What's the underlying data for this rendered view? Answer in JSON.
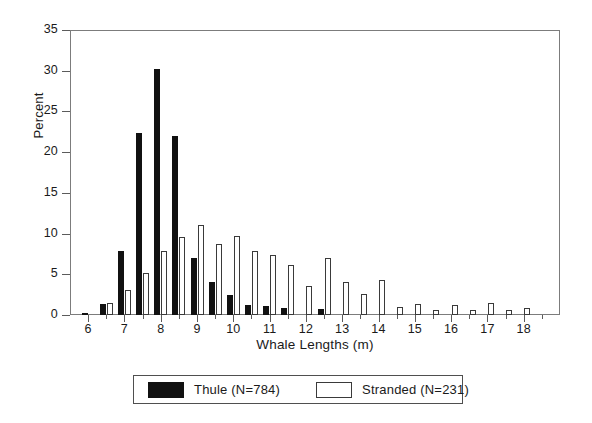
{
  "chart_data": {
    "type": "bar",
    "title": "",
    "xlabel": "Whale Lengths (m)",
    "ylabel": "Percent",
    "xlim": [
      5.5,
      19.0
    ],
    "ylim": [
      0,
      35
    ],
    "ytick_values": [
      0,
      5,
      10,
      15,
      20,
      25,
      30,
      35
    ],
    "ytick_labels": [
      "0",
      "5",
      "10",
      "15",
      "20",
      "25",
      "30",
      "35"
    ],
    "xtick_major_values": [
      6,
      7,
      8,
      9,
      10,
      11,
      12,
      13,
      14,
      15,
      16,
      17,
      18
    ],
    "xtick_major_labels": [
      "6",
      "7",
      "8",
      "9",
      "10",
      "11",
      "12",
      "13",
      "14",
      "15",
      "16",
      "17",
      "18"
    ],
    "xtick_minor_values": [
      6.5,
      7.5,
      8.5,
      9.5,
      10.5,
      11.5,
      12.5,
      13.5,
      14.5,
      15.5,
      16.5,
      17.5,
      18.5
    ],
    "grid": false,
    "legend_position": "below-plot",
    "bin_width": 0.5,
    "x": [
      6.0,
      6.5,
      7.0,
      7.5,
      8.0,
      8.5,
      9.0,
      9.5,
      10.0,
      10.5,
      11.0,
      11.5,
      12.0,
      12.5,
      13.0,
      13.5,
      14.0,
      14.5,
      15.0,
      15.5,
      16.0,
      16.5,
      17.0,
      17.5,
      18.0
    ],
    "series": [
      {
        "name": "Thule (N=784)",
        "color": "#111111",
        "fill": "solid",
        "values": [
          0.2,
          1.4,
          7.9,
          22.3,
          30.2,
          22.0,
          7.0,
          4.0,
          2.5,
          1.2,
          1.1,
          0.8,
          0.0,
          0.7,
          0.0,
          0.0,
          0.0,
          0.0,
          0.0,
          0.0,
          0.0,
          0.0,
          0.0,
          0.0,
          0.0
        ]
      },
      {
        "name": "Stranded (N=231)",
        "color": "#ffffff",
        "fill": "open",
        "values": [
          0.0,
          1.5,
          3.1,
          5.2,
          7.9,
          9.6,
          11.0,
          8.7,
          9.7,
          7.8,
          7.4,
          6.1,
          3.6,
          7.0,
          4.0,
          2.6,
          4.3,
          1.0,
          1.3,
          0.6,
          1.2,
          0.6,
          1.5,
          0.6,
          0.9
        ]
      }
    ]
  },
  "axes": {
    "y_title": "Percent",
    "x_title": "Whale Lengths (m)"
  },
  "legend": {
    "entries": [
      {
        "label": "Thule (N=784)",
        "swatch": "filled-black"
      },
      {
        "label": "Stranded (N=231)",
        "swatch": "open-white"
      }
    ]
  },
  "colors": {
    "thule": "#111111",
    "stranded_outline": "#3a3a3a",
    "axis": "#5b5b5b",
    "frame": "#7c7c7c",
    "background": "#ffffff"
  }
}
